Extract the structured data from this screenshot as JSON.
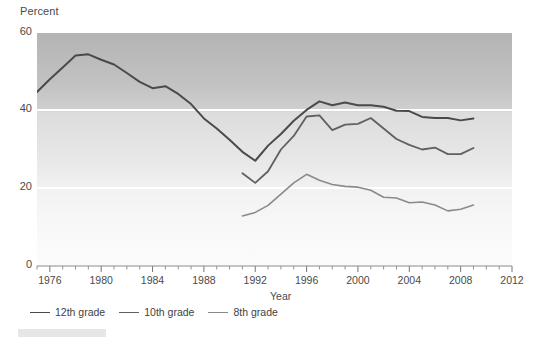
{
  "chart_data": {
    "type": "line",
    "title": "",
    "xlabel": "Year",
    "ylabel": "Percent",
    "xlim": [
      1975,
      2012
    ],
    "ylim": [
      0,
      60
    ],
    "yticks": [
      0,
      20,
      40,
      60
    ],
    "xticks": [
      1976,
      1980,
      1984,
      1988,
      1992,
      1996,
      2000,
      2004,
      2008,
      2012
    ],
    "xtick_minor_step": 1,
    "grid": "horizontal-white-lines",
    "legend_position": "below-axis-left",
    "series": [
      {
        "name": "12th grade",
        "color": "#4a4a4a",
        "x": [
          1975,
          1976,
          1977,
          1978,
          1979,
          1980,
          1981,
          1982,
          1983,
          1984,
          1985,
          1986,
          1987,
          1988,
          1989,
          1990,
          1991,
          1992,
          1993,
          1994,
          1995,
          1996,
          1997,
          1998,
          1999,
          2000,
          2001,
          2002,
          2003,
          2004,
          2005,
          2006,
          2007,
          2008,
          2009
        ],
        "values": [
          44.8,
          48.1,
          51.1,
          54.2,
          54.5,
          53.1,
          51.9,
          49.7,
          47.4,
          45.8,
          46.3,
          44.3,
          41.7,
          38.0,
          35.4,
          32.5,
          29.4,
          27.1,
          31.0,
          34.0,
          37.4,
          40.2,
          42.4,
          41.4,
          42.1,
          41.4,
          41.4,
          41.0,
          40.0,
          39.9,
          38.4,
          38.1,
          38.1,
          37.5,
          38.0
        ]
      },
      {
        "name": "10th grade",
        "color": "#606060",
        "x": [
          1991,
          1992,
          1993,
          1994,
          1995,
          1996,
          1997,
          1998,
          1999,
          2000,
          2001,
          2002,
          2003,
          2004,
          2005,
          2006,
          2007,
          2008,
          2009
        ],
        "values": [
          23.9,
          21.4,
          24.4,
          30.0,
          33.5,
          38.5,
          38.8,
          35.0,
          36.4,
          36.6,
          38.1,
          35.4,
          32.7,
          31.2,
          30.0,
          30.5,
          28.8,
          28.8,
          30.4
        ]
      },
      {
        "name": "8th grade",
        "color": "#8a8a8a",
        "x": [
          1991,
          1992,
          1993,
          1994,
          1995,
          1996,
          1997,
          1998,
          1999,
          2000,
          2001,
          2002,
          2003,
          2004,
          2005,
          2006,
          2007,
          2008,
          2009
        ],
        "values": [
          12.9,
          13.8,
          15.6,
          18.5,
          21.4,
          23.6,
          22.1,
          21.0,
          20.5,
          20.3,
          19.5,
          17.7,
          17.5,
          16.3,
          16.5,
          15.7,
          14.2,
          14.6,
          15.7
        ]
      }
    ]
  },
  "axes": {
    "y_title": "Percent",
    "x_title": "Year",
    "y_tick_labels": [
      "0",
      "20",
      "40",
      "60"
    ],
    "x_tick_labels": [
      "1976",
      "1980",
      "1984",
      "1988",
      "1992",
      "1996",
      "2000",
      "2004",
      "2008",
      "2012"
    ]
  },
  "legend": {
    "items": [
      {
        "label": "12th grade",
        "color": "#4a4a4a"
      },
      {
        "label": "10th grade",
        "color": "#606060"
      },
      {
        "label": "8th grade",
        "color": "#8a8a8a"
      }
    ]
  },
  "colors": {
    "plot_bg_top": "#b7b7b7",
    "plot_bg_bottom": "#fbfbfb",
    "gridline": "#ffffff",
    "axis_text": "#4a4a4a",
    "page_bg": "#ffffff"
  }
}
